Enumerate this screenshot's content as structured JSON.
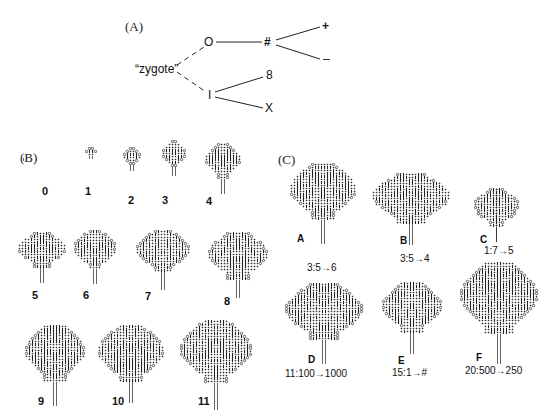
{
  "panel_a": {
    "label": "(A)",
    "root": "“zygote”",
    "nodes": {
      "o": "O",
      "hash": "#",
      "plus": "+",
      "minus": "–",
      "i": "I",
      "eight": "8",
      "x": "X"
    }
  },
  "panel_b": {
    "label": "(B)",
    "generations": [
      {
        "n": "0",
        "x": 22,
        "y": 147,
        "w": 6,
        "h": 9
      },
      {
        "n": "1",
        "x": 85,
        "y": 145,
        "w": 12,
        "h": 12
      },
      {
        "n": "2",
        "x": 123,
        "y": 147,
        "w": 18,
        "h": 24
      },
      {
        "n": "3",
        "x": 162,
        "y": 140,
        "w": 24,
        "h": 38
      },
      {
        "n": "4",
        "x": 205,
        "y": 143,
        "w": 36,
        "h": 52
      },
      {
        "n": "5",
        "x": 18,
        "y": 232,
        "w": 48,
        "h": 52
      },
      {
        "n": "6",
        "x": 74,
        "y": 230,
        "w": 44,
        "h": 56
      },
      {
        "n": "7",
        "x": 136,
        "y": 230,
        "w": 54,
        "h": 62
      },
      {
        "n": "8",
        "x": 208,
        "y": 232,
        "w": 62,
        "h": 66
      },
      {
        "n": "9",
        "x": 25,
        "y": 325,
        "w": 62,
        "h": 82
      },
      {
        "n": "10",
        "x": 98,
        "y": 325,
        "w": 66,
        "h": 80
      },
      {
        "n": "11",
        "x": 180,
        "y": 320,
        "w": 74,
        "h": 90
      }
    ],
    "number_positions": [
      {
        "x": 42,
        "y": 186
      },
      {
        "x": 85,
        "y": 186
      },
      {
        "x": 128,
        "y": 195
      },
      {
        "x": 162,
        "y": 195
      },
      {
        "x": 206,
        "y": 196
      },
      {
        "x": 32,
        "y": 290
      },
      {
        "x": 83,
        "y": 290
      },
      {
        "x": 145,
        "y": 291
      },
      {
        "x": 224,
        "y": 296
      },
      {
        "x": 38,
        "y": 396
      },
      {
        "x": 112,
        "y": 396
      },
      {
        "x": 198,
        "y": 396
      }
    ]
  },
  "panel_c": {
    "label": "(C)",
    "biomorphs": [
      {
        "letter": "A",
        "formula": "3:5→6",
        "formula_text": "3:5",
        "arrow": "→",
        "result": "6",
        "x": 290,
        "y": 163,
        "w": 66,
        "h": 82,
        "lx": 297,
        "ly": 234,
        "fx": 307,
        "fy": 263
      },
      {
        "letter": "B",
        "formula": "3:5→4",
        "formula_text": "3:5",
        "arrow": "→",
        "result": "4",
        "x": 372,
        "y": 173,
        "w": 78,
        "h": 72,
        "lx": 400,
        "ly": 236,
        "fx": 400,
        "fy": 254
      },
      {
        "letter": "C",
        "formula": "1:7→5",
        "formula_text": "1:7",
        "arrow": "→",
        "result": "5",
        "x": 474,
        "y": 188,
        "w": 46,
        "h": 54,
        "lx": 480,
        "ly": 235,
        "fx": 484,
        "fy": 246
      },
      {
        "letter": "D",
        "formula": "11:100→1000",
        "formula_text": "11:100",
        "arrow": "→",
        "result": "1000",
        "x": 285,
        "y": 283,
        "w": 80,
        "h": 82,
        "lx": 308,
        "ly": 355,
        "fx": 285,
        "fy": 369
      },
      {
        "letter": "E",
        "formula": "15:1→#",
        "formula_text": "15:1",
        "arrow": "→",
        "result": "#",
        "x": 382,
        "y": 282,
        "w": 62,
        "h": 74,
        "lx": 398,
        "ly": 356,
        "fx": 392,
        "fy": 368
      },
      {
        "letter": "F",
        "formula": "20:500→250",
        "formula_text": "20:500",
        "arrow": "→",
        "result": "250",
        "x": 460,
        "y": 262,
        "w": 80,
        "h": 102,
        "lx": 476,
        "ly": 353,
        "fx": 465,
        "fy": 366
      }
    ]
  }
}
